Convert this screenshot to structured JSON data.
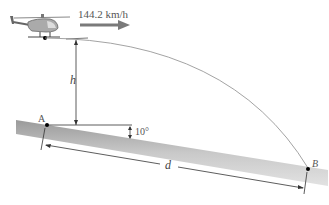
{
  "diagram": {
    "speed_label": "144.2 km/h",
    "height_label": "h",
    "distance_label": "d",
    "angle_label": "10°",
    "point_a_label": "A",
    "point_b_label": "B",
    "colors": {
      "slope_fill": "#c8c8c8",
      "trajectory": "#999999",
      "arrow": "#7a7a7a",
      "line": "#333333"
    }
  }
}
